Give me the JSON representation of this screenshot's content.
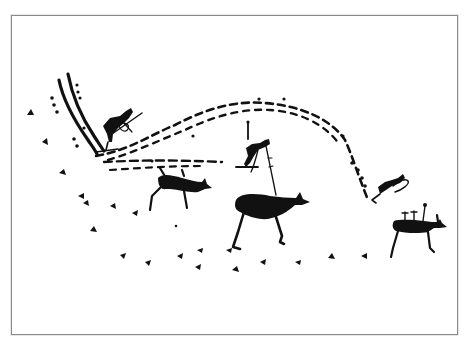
{
  "figure": {
    "type": "rock-art line illustration",
    "ink_color": "#111111",
    "background_color": "#ffffff",
    "frame_color": "#8a8a8a",
    "elements": [
      {
        "name": "double-line-track",
        "description": "two parallel curved lines descending from upper left"
      },
      {
        "name": "dashed-arc-trail",
        "description": "dashed ski track arcing over the scene"
      },
      {
        "name": "skier-left",
        "description": "human figure on skis with pole, upper left"
      },
      {
        "name": "skier-center",
        "description": "human figure on skis with staff, center"
      },
      {
        "name": "skier-right",
        "description": "small figure on skis descending at right"
      },
      {
        "name": "elk-small",
        "description": "small elk/reindeer, left of center"
      },
      {
        "name": "elk-large",
        "description": "large elk, center"
      },
      {
        "name": "elk-right",
        "description": "elk with upright marks on back, right"
      },
      {
        "name": "hoofprint-trail",
        "description": "curving line of small hoof/track marks along bottom"
      }
    ]
  }
}
